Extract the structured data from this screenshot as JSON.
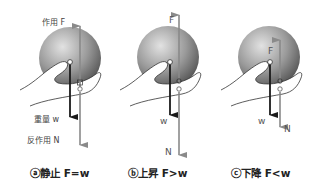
{
  "panels": [
    {
      "id": "a",
      "caption": "ⓐ静止 F=w",
      "labels": {
        "F": "作用 F",
        "w": "重量 w",
        "N": "反作用 N"
      },
      "state": "static",
      "relation": "F=w"
    },
    {
      "id": "b",
      "caption": "ⓑ上昇 F>w",
      "labels": {
        "F": "F",
        "w": "w",
        "N": "N"
      },
      "state": "rising",
      "relation": "F>w"
    },
    {
      "id": "c",
      "caption": "ⓒ下降 F<w",
      "labels": {
        "F": "F",
        "w": "w",
        "N": "N"
      },
      "state": "falling",
      "relation": "F<w"
    }
  ],
  "colors": {
    "weight_arrow": "#1a1a1a",
    "force_arrow": "#8a8a8a",
    "sphere_light": "#d8d8d8",
    "sphere_dark": "#5a5a5a"
  }
}
